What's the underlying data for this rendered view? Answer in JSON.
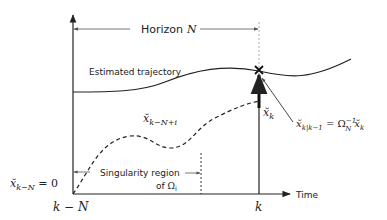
{
  "diagram": {
    "colors": {
      "stroke": "#222222",
      "guide": "#888888",
      "text": "#222222"
    },
    "horizon": {
      "label": "Horizon",
      "symbol": "N"
    },
    "axes": {
      "x_label": "Time",
      "x_ticks": [
        {
          "label_main": "k",
          "label_rest": " − N"
        },
        {
          "label_main": "k",
          "label_rest": ""
        }
      ]
    },
    "curves": {
      "estimated": {
        "label": "Estimated trajectory"
      },
      "error": {
        "label_main": "x̆",
        "label_sub": "k−N+i"
      }
    },
    "initial_condition": {
      "var": "x̆",
      "sub": "k−N",
      "rhs": " = 0"
    },
    "current_point": {
      "var": "x̆",
      "sub": "k"
    },
    "prediction": {
      "var": "x̆",
      "sub": "k|k−1",
      "eq": " = Ω",
      "omega_sub": "N",
      "omega_sup": "−1",
      "rhs_var": "x̆",
      "rhs_sub": "k"
    },
    "singularity": {
      "line1": "Singularity region",
      "line2_prefix": "of ",
      "omega": "Ω",
      "omega_sub": "i"
    }
  }
}
